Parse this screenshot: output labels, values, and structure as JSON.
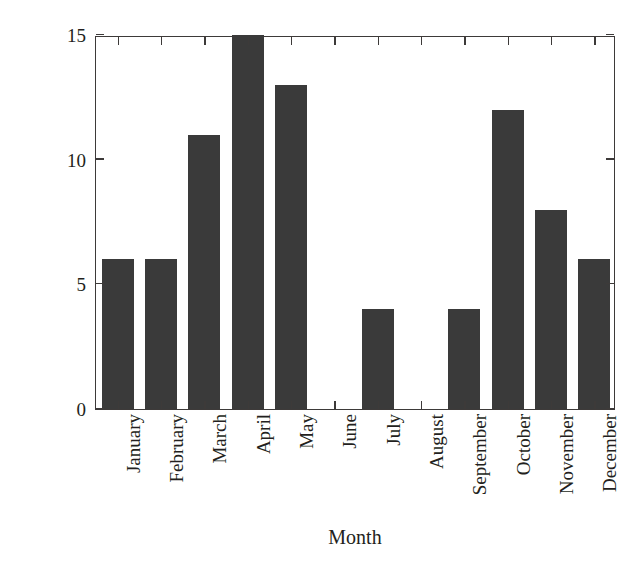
{
  "chart_data": {
    "type": "bar",
    "title": "",
    "xlabel": "Month",
    "ylabel": "Number of events",
    "categories": [
      "January",
      "February",
      "March",
      "April",
      "May",
      "June",
      "July",
      "August",
      "September",
      "October",
      "November",
      "December"
    ],
    "values": [
      6,
      6,
      11,
      15,
      13,
      0,
      4,
      0,
      4,
      12,
      8,
      6
    ],
    "ylim": [
      0,
      15
    ],
    "yticks": [
      0,
      5,
      10,
      15
    ],
    "ytick_labels": [
      "0",
      "5",
      "10",
      "15"
    ],
    "grid": false,
    "legend": null,
    "series": [
      {
        "name": "Number of events",
        "values": [
          6,
          6,
          11,
          15,
          13,
          0,
          4,
          0,
          4,
          12,
          8,
          6
        ]
      }
    ],
    "bar_color": "#3a3a3a",
    "axis_color": "#3d3a39",
    "background_color": "#ffffff",
    "xtick_rotation": -90,
    "annotations": []
  }
}
